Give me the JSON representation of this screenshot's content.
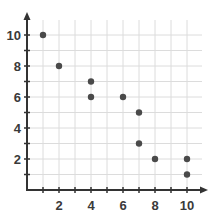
{
  "chart_data": {
    "type": "scatter",
    "title": "",
    "xlabel": "",
    "ylabel": "",
    "xlim": [
      0,
      11
    ],
    "ylim": [
      0,
      11
    ],
    "grid": true,
    "legend": null,
    "x_ticks": [
      2,
      4,
      6,
      8,
      10
    ],
    "y_ticks": [
      2,
      4,
      6,
      8,
      10
    ],
    "series": [
      {
        "name": "points",
        "color": "#4a4a4a",
        "points": [
          {
            "x": 1,
            "y": 10
          },
          {
            "x": 2,
            "y": 8
          },
          {
            "x": 4,
            "y": 7
          },
          {
            "x": 4,
            "y": 6
          },
          {
            "x": 6,
            "y": 6
          },
          {
            "x": 7,
            "y": 5
          },
          {
            "x": 7,
            "y": 3
          },
          {
            "x": 8,
            "y": 2
          },
          {
            "x": 10,
            "y": 2
          },
          {
            "x": 10,
            "y": 1
          }
        ]
      }
    ]
  },
  "style": {
    "axis_color": "#333333",
    "grid_color": "#dcdcdc",
    "point_color": "#4a4a4a"
  }
}
